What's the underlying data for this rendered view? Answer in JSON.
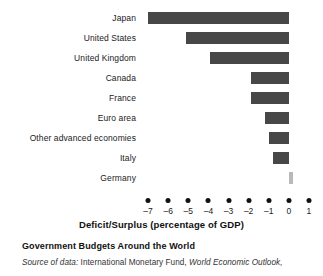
{
  "chart_data": {
    "type": "bar",
    "orientation": "horizontal",
    "title": "Government Budgets Around the World",
    "xlabel": "Deficit/Surplus (percentage of GDP)",
    "ylabel": "",
    "xlim": [
      -7.6,
      1.4
    ],
    "xticks": [
      -7,
      -6,
      -5,
      -4,
      -3,
      -2,
      -1,
      0,
      1
    ],
    "xticklabels": [
      "–7",
      "–6",
      "–5",
      "–4",
      "–3",
      "–2",
      "–1",
      "0",
      "1"
    ],
    "grid": false,
    "legend": null,
    "categories": [
      "Japan",
      "United States",
      "United Kingdom",
      "Canada",
      "France",
      "Euro area",
      "Other advanced economies",
      "Italy",
      "Germany"
    ],
    "values": [
      -7.0,
      -5.1,
      -3.9,
      -1.9,
      -1.9,
      -1.2,
      -1.0,
      -0.8,
      0.2
    ],
    "bar_colors": [
      "#474747",
      "#474747",
      "#474747",
      "#474747",
      "#474747",
      "#474747",
      "#474747",
      "#474747",
      "#b9b9b9"
    ],
    "source_lead": "Source of data:",
    "source_body": " International Monetary Fund, ",
    "source_publication": "World Economic Outlook,"
  }
}
